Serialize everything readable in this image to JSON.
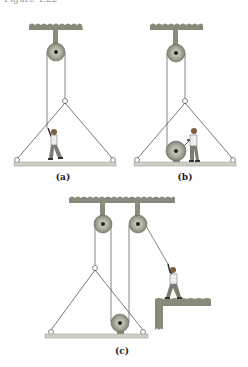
{
  "caption_fragment": "Figure 4.22",
  "colors": {
    "ceiling": "#8a8a7a",
    "pulley": "#a8a89a",
    "rope": "#555555",
    "platform": "#c9c9bf",
    "ledge": "#8a8a7a"
  },
  "panels": [
    {
      "id": "a",
      "label": "(a)",
      "description": "Person standing on suspended platform pulls rope over a single fixed pulley"
    },
    {
      "id": "b",
      "label": "(b)",
      "description": "Person on suspended platform operates a winch drum attached to the rope over a single fixed pulley"
    },
    {
      "id": "c",
      "label": "(c)",
      "description": "Platform with pulley hung from two fixed pulleys; person on separate ledge pulls the rope"
    }
  ]
}
